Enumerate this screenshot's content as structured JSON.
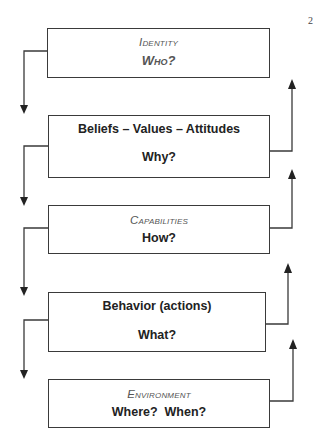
{
  "page_number": "2",
  "colors": {
    "line": "#3a3a3a",
    "label_muted": "#555555",
    "text": "#222222"
  },
  "levels": [
    {
      "title": "Identity",
      "question": "Who?"
    },
    {
      "title": "Beliefs – Values – Attitudes",
      "question": "Why?"
    },
    {
      "title": "Capabilities",
      "question": "How?"
    },
    {
      "title": "Behavior (actions)",
      "question": "What?"
    },
    {
      "title": "Environment",
      "question": "Where?  When?"
    }
  ]
}
